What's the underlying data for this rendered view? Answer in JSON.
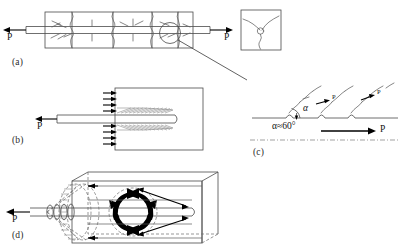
{
  "figure": {
    "background_color": "#ffffff",
    "line_color": "#4a4a4a",
    "crack_color": "#5f5f5f",
    "arrow_color": "#000000"
  },
  "panels": [
    {
      "id": "a",
      "label": "(a)",
      "description": "Reinforcing bar embedded in concrete prism with transverse cracks, loaded in tension at both ends",
      "left_load_label": "P",
      "right_load_label": "P",
      "detail_circle": true
    },
    {
      "id": "b",
      "label": "(b)",
      "description": "Bar pullout from concrete block showing inclined bond struts and reaction arrows on the bearing face",
      "load_label": "P"
    },
    {
      "id": "c",
      "label": "(c)",
      "description": "Magnified detail of inclined secondary cracks emanating from bar ribs",
      "angle_label": "α≈60°",
      "load_label": "P",
      "branch_labels": [
        "P",
        "P"
      ]
    },
    {
      "id": "d",
      "label": "(d)",
      "description": "Three dimensional view of conical pullout failure surface with circumferential ring tension",
      "load_label": "P"
    }
  ],
  "detail_inset": {
    "label": "",
    "description": "Square inset showing Y-shaped triple-junction crack pattern around the bar"
  }
}
